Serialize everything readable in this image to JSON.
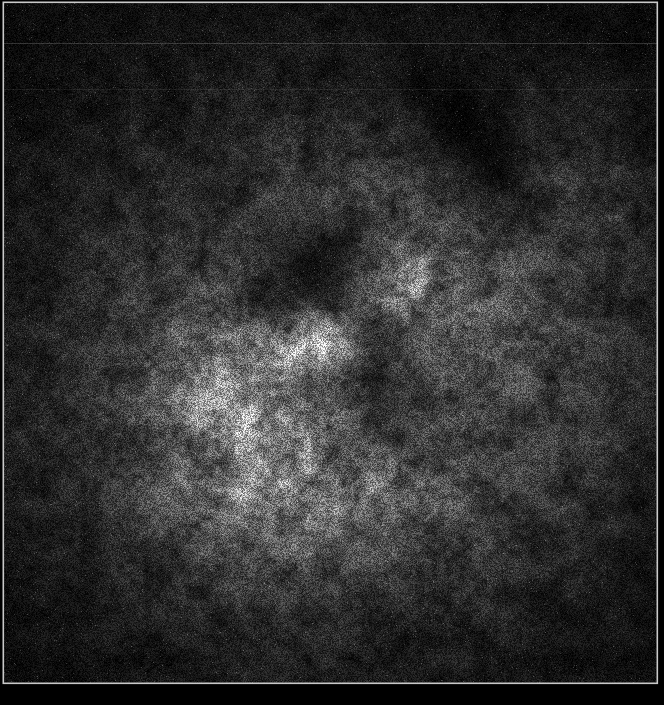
{
  "figure": {
    "width": 664,
    "height": 705,
    "background_color": "#000000",
    "max_value": 252,
    "frame": {
      "x": 3,
      "y": 2,
      "width": 654,
      "height": 681,
      "color": "#c9c9c9",
      "line_width": 1.6
    },
    "artifact_lines": [
      {
        "y": 43,
        "alpha": 0.2
      },
      {
        "y": 89,
        "alpha": 0.09
      }
    ],
    "noise": {
      "seed": 20240905,
      "base_level": 7,
      "white_abs": 8,
      "white_rel": 0.4,
      "salt_probability": 0.012,
      "salt_min": 18,
      "salt_range": 40,
      "octaves": [
        {
          "cell": 22,
          "amp": 0.36
        },
        {
          "cell": 7,
          "amp": 0.28
        }
      ]
    },
    "blobs": [
      {
        "name": "diffuse-halo",
        "cx": 332,
        "cy": 375,
        "sx": 205,
        "sy": 185,
        "rot": 0,
        "amp": 72
      },
      {
        "name": "left-bright-region",
        "cx": 240,
        "cy": 408,
        "sx": 50,
        "sy": 68,
        "rot": 10,
        "amp": 68
      },
      {
        "name": "lower-bright-arc",
        "cx": 322,
        "cy": 498,
        "sx": 92,
        "sy": 42,
        "rot": -8,
        "amp": 46
      },
      {
        "name": "central-bright-knot",
        "cx": 318,
        "cy": 338,
        "sx": 23,
        "sy": 19,
        "rot": 0,
        "amp": 115
      },
      {
        "name": "northeast-bright-knot",
        "cx": 396,
        "cy": 287,
        "sx": 27,
        "sy": 23,
        "rot": 0,
        "amp": 72
      },
      {
        "name": "right-lobe-glow",
        "cx": 500,
        "cy": 360,
        "sx": 85,
        "sy": 95,
        "rot": 0,
        "amp": 20
      },
      {
        "name": "upper-right-arm-glow",
        "cx": 565,
        "cy": 205,
        "sx": 60,
        "sy": 65,
        "rot": 0,
        "amp": 24
      },
      {
        "name": "upper-mid-glow",
        "cx": 385,
        "cy": 205,
        "sx": 70,
        "sy": 50,
        "rot": 0,
        "amp": 16
      },
      {
        "name": "central-dark-cavity",
        "cx": 320,
        "cy": 270,
        "sx": 48,
        "sy": 42,
        "rot": -50,
        "amp": -58
      },
      {
        "name": "dark-bridge",
        "cx": 362,
        "cy": 332,
        "sx": 26,
        "sy": 36,
        "rot": -40,
        "amp": -24
      },
      {
        "name": "southeast-dark-cavity",
        "cx": 395,
        "cy": 408,
        "sx": 44,
        "sy": 38,
        "rot": 0,
        "amp": -44
      },
      {
        "name": "northeast-dark-lane",
        "cx": 490,
        "cy": 168,
        "sx": 82,
        "sy": 30,
        "rot": 52,
        "amp": -36
      },
      {
        "name": "west-dark-notch",
        "cx": 272,
        "cy": 302,
        "sx": 30,
        "sy": 24,
        "rot": 0,
        "amp": -18
      }
    ]
  }
}
